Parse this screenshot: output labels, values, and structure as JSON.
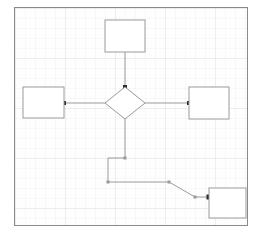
{
  "app": {
    "title": "Flowchart Diagram",
    "canvas": {
      "background_color": "#fefefe",
      "border_color": "#8a8a8a",
      "grid_visible": "true",
      "grid_spacing": "10"
    }
  },
  "diagram": {
    "shape_stroke_color": "#9a9a9a",
    "shape_fill_color": "#ffffff",
    "connector_color": "#9a9a9a",
    "endpoint_marker_color": "#2b2b2b",
    "nodes": [
      {
        "id": "node-top",
        "type": "rectangle",
        "label": "",
        "x": 90,
        "y": 12,
        "width": 40,
        "height": 32
      },
      {
        "id": "node-left",
        "type": "rectangle",
        "label": "",
        "x": 8,
        "y": 79,
        "width": 41,
        "height": 31
      },
      {
        "id": "node-decision",
        "type": "diamond",
        "label": "",
        "x": 90,
        "y": 79,
        "width": 40,
        "height": 32
      },
      {
        "id": "node-right",
        "type": "rectangle",
        "label": "",
        "x": 174,
        "y": 79,
        "width": 40,
        "height": 32
      },
      {
        "id": "node-bottom-right",
        "type": "rectangle",
        "label": "",
        "x": 194,
        "y": 180,
        "width": 37,
        "height": 30
      }
    ],
    "edges": [
      {
        "id": "edge-top-to-decision",
        "from": "node-top",
        "to": "node-decision",
        "label": "",
        "points": "110,44 110,79",
        "endpoint": {
          "x": 110,
          "y": 79
        },
        "waypoints": []
      },
      {
        "id": "edge-decision-to-left",
        "from": "node-decision",
        "to": "node-left",
        "label": "",
        "points": "90,95 49,95",
        "endpoint": {
          "x": 49,
          "y": 95
        },
        "waypoints": []
      },
      {
        "id": "edge-decision-to-right",
        "from": "node-decision",
        "to": "node-right",
        "label": "",
        "points": "130,95 174,95",
        "endpoint": {
          "x": 174,
          "y": 95
        },
        "waypoints": []
      },
      {
        "id": "edge-decision-to-bottom-right",
        "from": "node-decision",
        "to": "node-bottom-right",
        "label": "",
        "points": "110,111 110,150 93,150 93,174 154,174 180,189 194,189",
        "endpoint": {
          "x": 194,
          "y": 189
        },
        "waypoints": [
          {
            "x": 110,
            "y": 150
          },
          {
            "x": 93,
            "y": 174
          },
          {
            "x": 154,
            "y": 174
          },
          {
            "x": 180,
            "y": 189
          }
        ]
      }
    ]
  }
}
